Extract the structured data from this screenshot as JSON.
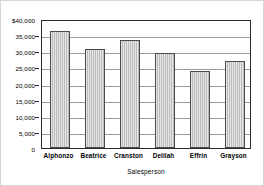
{
  "chart_data": {
    "type": "bar",
    "title": "",
    "xlabel": "Salesperson",
    "ylabel": "",
    "categories": [
      "Alphonzo",
      "Beatrice",
      "Cranston",
      "Delilah",
      "Effrin",
      "Grayson"
    ],
    "values": [
      36200,
      30700,
      33500,
      29400,
      24000,
      27000
    ],
    "ylim": [
      0,
      40000
    ],
    "ytick_values": [
      40000,
      35000,
      30000,
      25000,
      20000,
      15000,
      10000,
      5000,
      0
    ],
    "ytick_labels": [
      "$40,000",
      "35,000",
      "30,000",
      "25,000",
      "20,000",
      "15,000",
      "10,000",
      "5,000",
      "0"
    ],
    "grid": true,
    "legend": false,
    "bar_color": "#c8c8c8",
    "bar_edge_color": "#4a4a4a",
    "gridline_color": "#9a9a9a",
    "axis_color": "#2b2b2b",
    "background_color": "#ffffff"
  }
}
